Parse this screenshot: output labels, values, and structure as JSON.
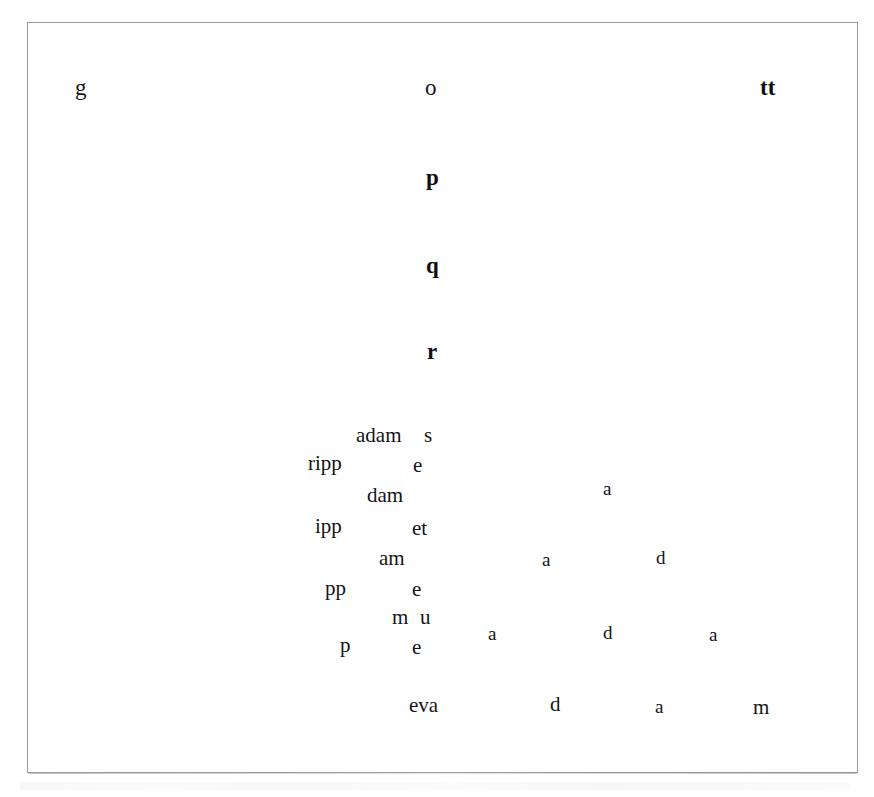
{
  "page": {
    "background_color": "#ffffff",
    "ink_color": "#15131a",
    "frame_color": "#9a9a9a",
    "width": 874,
    "height": 797
  },
  "plate": {
    "frame": {
      "x": 27,
      "y": 22,
      "width": 831,
      "height": 751
    }
  },
  "composition": {
    "description": "Scattered single letters and word fragments of the word 'adam' / 'ripple' arranged in a dispersing pattern",
    "glyphs": [
      {
        "text": "g",
        "x": 74,
        "y": 75,
        "size": "lg",
        "weight": "normal"
      },
      {
        "text": "o",
        "x": 424,
        "y": 75,
        "size": "lg",
        "weight": "normal"
      },
      {
        "text": "tt",
        "x": 759,
        "y": 75,
        "size": "lg",
        "weight": "heavy"
      },
      {
        "text": "p",
        "x": 425,
        "y": 165,
        "size": "lg",
        "weight": "heavy"
      },
      {
        "text": "q",
        "x": 425,
        "y": 253,
        "size": "lg",
        "weight": "heavy"
      },
      {
        "text": "r",
        "x": 426,
        "y": 339,
        "size": "lg",
        "weight": "heavy"
      },
      {
        "text": "adam",
        "x": 355,
        "y": 424,
        "size": "md",
        "weight": "normal"
      },
      {
        "text": "s",
        "x": 423,
        "y": 424,
        "size": "md",
        "weight": "normal"
      },
      {
        "text": "ripp",
        "x": 307,
        "y": 452,
        "size": "md",
        "weight": "normal"
      },
      {
        "text": "e",
        "x": 412,
        "y": 454,
        "size": "md",
        "weight": "normal"
      },
      {
        "text": "a",
        "x": 602,
        "y": 478,
        "size": "sm",
        "weight": "normal"
      },
      {
        "text": "dam",
        "x": 366,
        "y": 484,
        "size": "md",
        "weight": "normal"
      },
      {
        "text": "ipp",
        "x": 314,
        "y": 515,
        "size": "md",
        "weight": "normal"
      },
      {
        "text": "et",
        "x": 411,
        "y": 517,
        "size": "md",
        "weight": "normal"
      },
      {
        "text": "am",
        "x": 378,
        "y": 547,
        "size": "md",
        "weight": "normal"
      },
      {
        "text": "a",
        "x": 541,
        "y": 549,
        "size": "sm",
        "weight": "normal"
      },
      {
        "text": "d",
        "x": 655,
        "y": 547,
        "size": "sm",
        "weight": "normal"
      },
      {
        "text": "pp",
        "x": 324,
        "y": 577,
        "size": "md",
        "weight": "normal"
      },
      {
        "text": "e",
        "x": 411,
        "y": 578,
        "size": "md",
        "weight": "normal"
      },
      {
        "text": "m",
        "x": 391,
        "y": 606,
        "size": "md",
        "weight": "normal"
      },
      {
        "text": "u",
        "x": 419,
        "y": 606,
        "size": "md",
        "weight": "normal"
      },
      {
        "text": "a",
        "x": 487,
        "y": 623,
        "size": "sm",
        "weight": "normal"
      },
      {
        "text": "d",
        "x": 602,
        "y": 622,
        "size": "sm",
        "weight": "normal"
      },
      {
        "text": "a",
        "x": 708,
        "y": 624,
        "size": "sm",
        "weight": "normal"
      },
      {
        "text": "p",
        "x": 339,
        "y": 634,
        "size": "md",
        "weight": "normal"
      },
      {
        "text": "e",
        "x": 411,
        "y": 636,
        "size": "md",
        "weight": "normal"
      },
      {
        "text": "eva",
        "x": 408,
        "y": 694,
        "size": "md",
        "weight": "normal"
      },
      {
        "text": "d",
        "x": 549,
        "y": 693,
        "size": "md",
        "weight": "normal"
      },
      {
        "text": "a",
        "x": 654,
        "y": 696,
        "size": "sm",
        "weight": "normal"
      },
      {
        "text": "m",
        "x": 752,
        "y": 696,
        "size": "md",
        "weight": "normal"
      }
    ]
  }
}
